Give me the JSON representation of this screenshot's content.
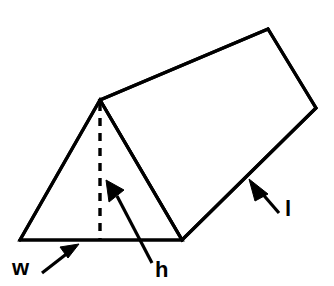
{
  "figure": {
    "name": "triangular-prism-dimensions-diagram",
    "background_color": "#ffffff",
    "line_color": "#000000",
    "fill_color": "#ffffff"
  },
  "labels": [
    {
      "id": "width",
      "text": "w",
      "x": 12,
      "y": 275,
      "meaning": "width of the triangular base"
    },
    {
      "id": "height",
      "text": "h",
      "x": 155,
      "y": 277,
      "meaning": "height of the triangular face"
    },
    {
      "id": "length",
      "text": "l",
      "x": 285,
      "y": 216,
      "meaning": "length of the prism"
    }
  ],
  "geometry": {
    "triangle_front": {
      "apex": [
        100,
        100
      ],
      "bottom_left": [
        20,
        240
      ],
      "bottom_right": [
        182,
        240
      ]
    },
    "top_ridge": [
      [
        100,
        100
      ],
      [
        268,
        29
      ]
    ],
    "back_right_edge": [
      [
        268,
        29
      ],
      [
        316,
        108
      ]
    ],
    "bottom_slant_edge": [
      [
        316,
        108
      ],
      [
        182,
        240
      ]
    ],
    "height_dashed_line": [
      [
        100,
        103
      ],
      [
        100,
        239
      ]
    ]
  },
  "leaders": {
    "width_arrow": {
      "tail": [
        42,
        273
      ],
      "tip": [
        78,
        245
      ]
    },
    "height_arrow": {
      "tail": [
        152,
        263
      ],
      "tip": [
        107,
        182
      ]
    },
    "length_arrow": {
      "tail": [
        279,
        213
      ],
      "tip": [
        251,
        181
      ]
    }
  }
}
